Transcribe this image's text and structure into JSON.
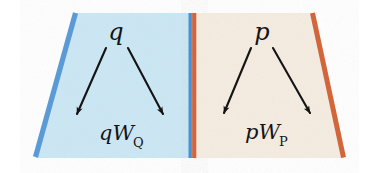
{
  "diagram": {
    "background_color": "#ffffff",
    "panels": [
      {
        "id": "left-panel",
        "name": "q-panel",
        "fill_color": "#cde8f5",
        "edge_color": "#5b9bd5",
        "edge_side": "left",
        "top_label": "q",
        "bottom_label_base": "qW",
        "bottom_label_subscript": "Q",
        "arrows": [
          {
            "name": "arrow-down-left",
            "direction": "down-left"
          },
          {
            "name": "arrow-down-right",
            "direction": "down-right"
          }
        ]
      },
      {
        "id": "right-panel",
        "name": "p-panel",
        "fill_color": "#f5ece2",
        "edge_color": "#d2663a",
        "edge_side": "right",
        "top_label": "p",
        "bottom_label_base": "pW",
        "bottom_label_subscript": "P",
        "arrows": [
          {
            "name": "arrow-down-left",
            "direction": "down-left"
          },
          {
            "name": "arrow-down-right",
            "direction": "down-right"
          }
        ]
      }
    ],
    "divider": {
      "name": "center-divider",
      "left_stripe_color": "#4a90d9",
      "right_stripe_color": "#d2663a"
    },
    "arrow_color": "#141414"
  }
}
